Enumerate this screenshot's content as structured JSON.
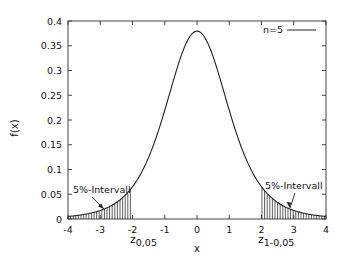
{
  "chart_data": {
    "type": "line",
    "title": "",
    "xlabel": "x",
    "ylabel": "f(x)",
    "xlim": [
      -4,
      4
    ],
    "ylim": [
      0,
      0.4
    ],
    "grid": false,
    "legend_position": "top-right",
    "x_ticks": [
      "-4",
      "-3",
      "-2",
      "-1",
      "0",
      "1",
      "2",
      "3",
      "4"
    ],
    "y_ticks": [
      "0",
      "0.05",
      "0.1",
      "0.15",
      "0.2",
      "0.25",
      "0.3",
      "0.35",
      "0.4"
    ],
    "series": [
      {
        "name": "n=5",
        "description": "Student t density, 5 degrees of freedom",
        "x": [
          -4,
          -3.5,
          -3,
          -2.5,
          -2,
          -1.5,
          -1,
          -0.5,
          0,
          0.5,
          1,
          1.5,
          2,
          2.5,
          3,
          3.5,
          4
        ],
        "values": [
          0.0051,
          0.009,
          0.0173,
          0.0361,
          0.0651,
          0.1245,
          0.2197,
          0.3279,
          0.3796,
          0.3279,
          0.2197,
          0.1245,
          0.0651,
          0.0361,
          0.0173,
          0.009,
          0.0051
        ]
      }
    ],
    "shaded_regions": [
      {
        "from": -4,
        "to": -2.015,
        "pattern": "vertical-hatch"
      },
      {
        "from": 2.015,
        "to": 4,
        "pattern": "vertical-hatch"
      }
    ],
    "annotations": [
      {
        "text": "5%-Intervall",
        "arrow_to_x": -2.9,
        "side": "left"
      },
      {
        "text": "5%-Intervall",
        "arrow_to_x": 2.8,
        "side": "right"
      },
      {
        "text": "z",
        "subscript": "0,05",
        "x": -2
      },
      {
        "text": "z",
        "subscript": "1-0,05",
        "x": 2
      }
    ]
  },
  "labels": {
    "ylabel": "f(x)",
    "xlabel": "x",
    "legend": "n=5",
    "left_interval": "5%-Intervall",
    "right_interval": "5%-Intervall",
    "z_left_main": "z",
    "z_left_sub": "0,05",
    "z_right_main": "z",
    "z_right_sub": "1-0,05"
  },
  "colors": {
    "line": "#222222",
    "axis": "#444444",
    "background": "#ffffff"
  }
}
